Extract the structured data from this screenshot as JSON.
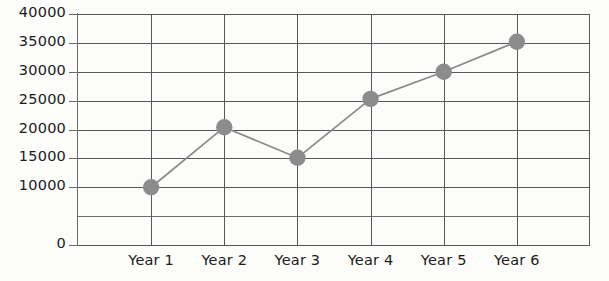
{
  "chart_data": {
    "type": "line",
    "title": "",
    "subtitle": "",
    "xlabel": "",
    "ylabel": "",
    "categories": [
      "Year 1",
      "Year 2",
      "Year 3",
      "Year 4",
      "Year 5",
      "Year 6"
    ],
    "values": [
      10000,
      20400,
      15100,
      25300,
      30000,
      35200
    ],
    "series": [
      {
        "name": "",
        "values": [
          10000,
          20400,
          15100,
          25300,
          30000,
          35200
        ]
      }
    ],
    "ylim": [
      0,
      40000
    ],
    "y_tick_values": [
      0,
      10000,
      15000,
      20000,
      25000,
      30000,
      35000,
      40000
    ],
    "y_tick_labels": [
      "0",
      "10000",
      "15000",
      "20000",
      "25000",
      "30000",
      "35000",
      "40000"
    ],
    "y_gridline_values": [
      0,
      5000,
      10000,
      15000,
      20000,
      25000,
      30000,
      35000,
      40000
    ],
    "x_tick_labels": [
      "Year 1",
      "Year 2",
      "Year 3",
      "Year 4",
      "Year 5",
      "Year 6"
    ],
    "grid": true,
    "legend": false,
    "legend_position": "none",
    "marker": "circle",
    "colors": {
      "line": "#8a8a8a",
      "marker": "#8c8c8c",
      "grid": "#585858",
      "axis": "#6b6b6b",
      "text": "#1b1b1b",
      "background": "#fcfcfa"
    }
  }
}
